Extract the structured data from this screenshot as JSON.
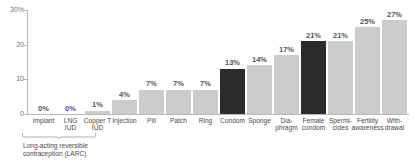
{
  "chart_data": {
    "type": "bar",
    "title": "",
    "xlabel": "",
    "ylabel": "",
    "ylim": [
      0,
      30
    ],
    "grid": false,
    "legend": "none",
    "y_ticks": [
      {
        "value": 30,
        "label": "30%"
      },
      {
        "value": 20,
        "label": "20"
      },
      {
        "value": 10,
        "label": "10"
      },
      {
        "value": 0,
        "label": "0"
      }
    ],
    "categories": [
      "Implant",
      "LNG\nIUD",
      "Copper T\nIUD",
      "Injection",
      "Pill",
      "Patch",
      "Ring",
      "Condom",
      "Sponge",
      "Dia-\nphragm",
      "Female\ncondom",
      "Spermi-\ncides",
      "Fertility\nawareness",
      "With-\ndrawal"
    ],
    "values": [
      0,
      0,
      1,
      4,
      7,
      7,
      7,
      13,
      14,
      17,
      21,
      21,
      25,
      27
    ],
    "value_labels": [
      "0%",
      "0%",
      "1%",
      "4%",
      "7%",
      "7%",
      "7%",
      "13%",
      "14%",
      "17%",
      "21%",
      "21%",
      "25%",
      "27%"
    ],
    "highlighted": [
      false,
      false,
      false,
      false,
      false,
      false,
      false,
      true,
      false,
      false,
      true,
      false,
      false,
      false
    ],
    "colors": {
      "bar_default": "#cccccc",
      "bar_highlight": "#2b2b2b",
      "axis": "#b8b8b8",
      "text": "#4a4a4a",
      "value_text": "#555555",
      "background": "#ffffff"
    }
  },
  "annotation": {
    "larc_caption": "Long-acting reversible\ncontraception (LARC)",
    "larc_span_start": 0,
    "larc_span_end": 2
  }
}
